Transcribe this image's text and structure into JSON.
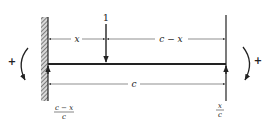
{
  "diagram": {
    "type": "beam-influence-line",
    "load": {
      "label": "1"
    },
    "dimensions": {
      "left_segment": "x",
      "right_segment": "c − x",
      "span": "c"
    },
    "reactions": {
      "left": {
        "numerator": "c − x",
        "denominator": "c"
      },
      "right": {
        "numerator": "x",
        "denominator": "c"
      }
    },
    "moments": {
      "left_sign": "+",
      "right_sign": "+"
    },
    "colors": {
      "ink": "#222222",
      "hatch": "#555555",
      "background": "#ffffff"
    }
  }
}
